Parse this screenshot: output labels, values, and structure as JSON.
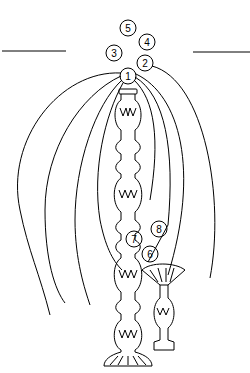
{
  "diagram": {
    "type": "line-drawing",
    "stroke_color": "#000000",
    "background": "#ffffff",
    "labels": [
      {
        "id": "1",
        "text": "1",
        "cx": 128,
        "cy": 76
      },
      {
        "id": "2",
        "text": "2",
        "cx": 145,
        "cy": 63
      },
      {
        "id": "3",
        "text": "3",
        "cx": 114,
        "cy": 53
      },
      {
        "id": "4",
        "text": "4",
        "cx": 147,
        "cy": 42
      },
      {
        "id": "5",
        "text": "5",
        "cx": 128,
        "cy": 28
      },
      {
        "id": "6",
        "text": "6",
        "cx": 150,
        "cy": 254
      },
      {
        "id": "7",
        "text": "7",
        "cx": 134,
        "cy": 239
      },
      {
        "id": "8",
        "text": "8",
        "cx": 159,
        "cy": 229
      }
    ],
    "elements": {
      "tall_column": "tall ornamented column",
      "short_column": "short ornamented column with flared capital",
      "horizon_lines": 2,
      "arcs_from_node_1": 8
    }
  }
}
